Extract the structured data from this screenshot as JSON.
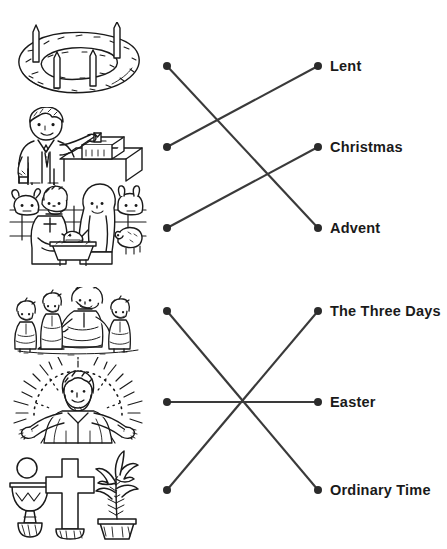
{
  "worksheet": {
    "type": "matching-activity",
    "cropped_header_text": "",
    "colors": {
      "ink": "#1a1a1a",
      "line": "#3a3a3a",
      "paper": "#ffffff"
    },
    "groups": [
      {
        "id": "top",
        "pictures": [
          {
            "id": "advent-wreath",
            "icon": "advent-wreath-illustration",
            "alt": "Advent wreath made of evergreen branches with four candles",
            "dot": {
              "x": 167,
              "y": 66
            }
          },
          {
            "id": "almsgiving",
            "icon": "almsgiving-illustration",
            "alt": "Person placing an offering into a collection box on a table",
            "dot": {
              "x": 167,
              "y": 147
            }
          },
          {
            "id": "nativity",
            "icon": "nativity-illustration",
            "alt": "Nativity scene with Mary, Joseph, baby in a manger, ox and sheep",
            "dot": {
              "x": 167,
              "y": 228
            }
          }
        ],
        "labels": [
          {
            "id": "lent",
            "text": "Lent",
            "dot": {
              "x": 318,
              "y": 66
            }
          },
          {
            "id": "christmas",
            "text": "Christmas",
            "dot": {
              "x": 318,
              "y": 147
            }
          },
          {
            "id": "advent",
            "text": "Advent",
            "dot": {
              "x": 318,
              "y": 228
            }
          }
        ],
        "connections": [
          {
            "from": "advent-wreath",
            "to": "advent",
            "x1": 167,
            "y1": 66,
            "x2": 318,
            "y2": 228
          },
          {
            "from": "almsgiving",
            "to": "lent",
            "x1": 167,
            "y1": 147,
            "x2": 318,
            "y2": 66
          },
          {
            "from": "nativity",
            "to": "christmas",
            "x1": 167,
            "y1": 228,
            "x2": 318,
            "y2": 147
          }
        ]
      },
      {
        "id": "bottom",
        "pictures": [
          {
            "id": "jesus-with-children",
            "icon": "jesus-teaching-children-illustration",
            "alt": "Jesus seated with children gathered around him",
            "dot": {
              "x": 167,
              "y": 311
            }
          },
          {
            "id": "risen-jesus",
            "icon": "risen-jesus-illustration",
            "alt": "Risen Jesus with arms outstretched and a radiating halo",
            "dot": {
              "x": 167,
              "y": 402
            }
          },
          {
            "id": "chalice-cross-palm",
            "icon": "chalice-cross-palm-illustration",
            "alt": "Chalice with host, a cross, and a palm plant in a pot",
            "dot": {
              "x": 167,
              "y": 490
            }
          }
        ],
        "labels": [
          {
            "id": "three-days",
            "text": "The Three Days",
            "dot": {
              "x": 318,
              "y": 311
            }
          },
          {
            "id": "easter",
            "text": "Easter",
            "dot": {
              "x": 318,
              "y": 402
            }
          },
          {
            "id": "ordinary-time",
            "text": "Ordinary Time",
            "dot": {
              "x": 318,
              "y": 490
            }
          }
        ],
        "connections": [
          {
            "from": "jesus-with-children",
            "to": "ordinary-time",
            "x1": 167,
            "y1": 311,
            "x2": 318,
            "y2": 490
          },
          {
            "from": "risen-jesus",
            "to": "easter",
            "x1": 167,
            "y1": 402,
            "x2": 318,
            "y2": 402
          },
          {
            "from": "chalice-cross-palm",
            "to": "three-days",
            "x1": 167,
            "y1": 490,
            "x2": 318,
            "y2": 311
          }
        ]
      }
    ]
  }
}
